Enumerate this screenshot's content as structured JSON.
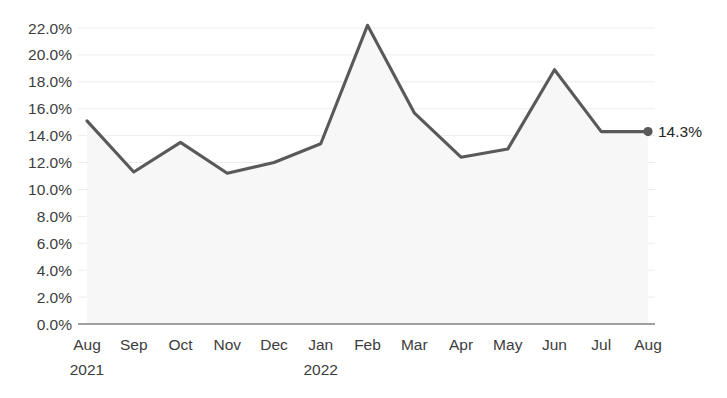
{
  "chart_data": {
    "type": "area",
    "title": "",
    "subtitle": "",
    "xlabel": "",
    "ylabel": "",
    "categories": [
      "Aug",
      "Sep",
      "Oct",
      "Nov",
      "Dec",
      "Jan",
      "Feb",
      "Mar",
      "Apr",
      "May",
      "Jun",
      "Jul",
      "Aug"
    ],
    "year_labels": [
      {
        "index": 0,
        "text": "2021"
      },
      {
        "index": 5,
        "text": "2022"
      }
    ],
    "values": [
      15.1,
      11.3,
      13.5,
      11.2,
      12.0,
      13.4,
      22.2,
      15.7,
      12.4,
      13.0,
      18.9,
      14.3,
      14.3
    ],
    "ylim": [
      0.0,
      22.0
    ],
    "ytick_values": [
      0.0,
      2.0,
      4.0,
      6.0,
      8.0,
      10.0,
      12.0,
      14.0,
      16.0,
      18.0,
      20.0,
      22.0
    ],
    "ytick_labels": [
      "0.0%",
      "2.0%",
      "4.0%",
      "6.0%",
      "8.0%",
      "10.0%",
      "12.0%",
      "14.0%",
      "16.0%",
      "18.0%",
      "20.0%",
      "22.0%"
    ],
    "grid": true,
    "legend": "none",
    "end_point_label": "14.3%",
    "end_point_marker": true,
    "colors": {
      "line": "#595959",
      "fill": "#f7f7f7",
      "grid": "#ededed",
      "axis": "#808080",
      "text": "#3d3d3d",
      "label_text": "#262626",
      "marker": "#595959",
      "background": "#ffffff"
    }
  }
}
